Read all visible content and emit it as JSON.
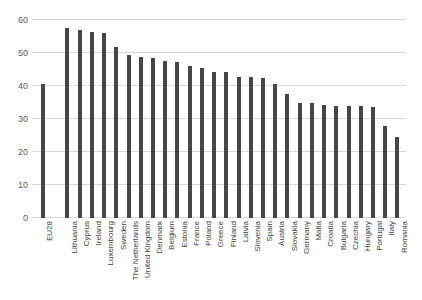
{
  "chart_data": {
    "type": "bar",
    "title": "",
    "xlabel": "",
    "ylabel": "",
    "ylim": [
      0,
      60
    ],
    "ytick_values": [
      0,
      10,
      20,
      30,
      40,
      50,
      60
    ],
    "ytick_labels": [
      "0",
      "10",
      "20",
      "30",
      "40",
      "50",
      "60"
    ],
    "grid": true,
    "legend": "none",
    "bar_color": "#464646",
    "gridline_color": "#d9d9d9",
    "gap_after_index": 0,
    "categories": [
      "EU28",
      "Lithuania",
      "Cyprus",
      "Ireland",
      "Luxembourg",
      "Sweden",
      "The Netherlands",
      "United Kingdom",
      "Denmark",
      "Belgium",
      "Estonia",
      "France",
      "Poland",
      "Greece",
      "Finland",
      "Latvia",
      "Slovenia",
      "Spain",
      "Austria",
      "Slovakia",
      "Germany",
      "Malta",
      "Croatia",
      "Bulgaria",
      "Czechia",
      "Hungary",
      "Portugal",
      "Italy",
      "Romania"
    ],
    "values": [
      40.6,
      57.6,
      57.1,
      56.3,
      56.2,
      51.8,
      49.4,
      48.9,
      48.4,
      47.6,
      47.2,
      46.1,
      45.6,
      44.3,
      44.1,
      42.7,
      42.6,
      42.3,
      40.6,
      37.7,
      35.0,
      34.8,
      34.2,
      33.8,
      33.8,
      33.8,
      33.5,
      27.9,
      24.6
    ]
  }
}
